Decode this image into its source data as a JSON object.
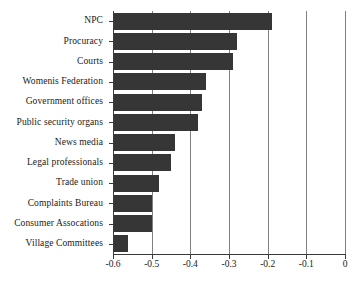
{
  "chart_data": {
    "type": "bar",
    "orientation": "horizontal",
    "title": "",
    "subtitle": "",
    "xlabel": "",
    "ylabel": "",
    "xlim": [
      -0.6,
      0
    ],
    "xticks": [
      -0.6,
      -0.5,
      -0.4,
      -0.3,
      -0.2,
      -0.1,
      0
    ],
    "xtick_labels": [
      "-0.6",
      "-0.5",
      "-0.4",
      "-0.3",
      "-0.2",
      "-0.1",
      "0"
    ],
    "grid": "vertical",
    "legend": "none",
    "bar_color": "#363636",
    "gridline_color": "#808080",
    "axis_color": "#3a3a3a",
    "categories": [
      "NPC",
      "Procuracy",
      "Courts",
      "Womenis Federation",
      "Government offices",
      "Public security organs",
      "News media",
      "Legal professionals",
      "Trade union",
      "Complaints Bureau",
      "Consumer Assocations",
      "Village Committees"
    ],
    "values": [
      -0.19,
      -0.28,
      -0.29,
      -0.36,
      -0.37,
      -0.38,
      -0.44,
      -0.45,
      -0.48,
      -0.5,
      -0.5,
      -0.56
    ]
  }
}
